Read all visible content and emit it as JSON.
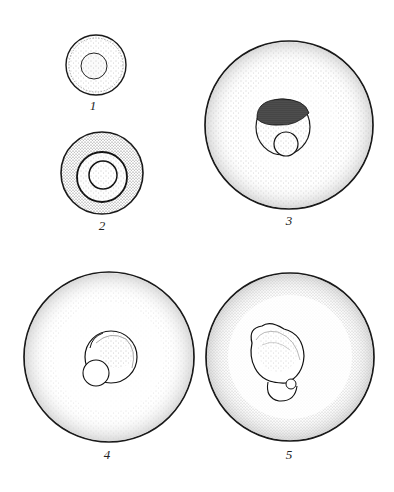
{
  "figure": {
    "type": "scientific-illustration",
    "panels": [
      {
        "id": 1,
        "label": "1",
        "description": "small cell with inner nucleus ring"
      },
      {
        "id": 2,
        "label": "2",
        "description": "cell with thick stippled wall, two concentric inner rings"
      },
      {
        "id": 3,
        "label": "3",
        "description": "large egg with central cell, dark pigmented cap and small inner sphere"
      },
      {
        "id": 4,
        "label": "4",
        "description": "large egg with early embryo in center"
      },
      {
        "id": 5,
        "label": "5",
        "description": "large egg with developing embryo, hatched shell texture"
      }
    ],
    "colors": {
      "ink": "#1a1a1a",
      "stipple": "#8a8a8a",
      "paper": "#ffffff"
    }
  }
}
